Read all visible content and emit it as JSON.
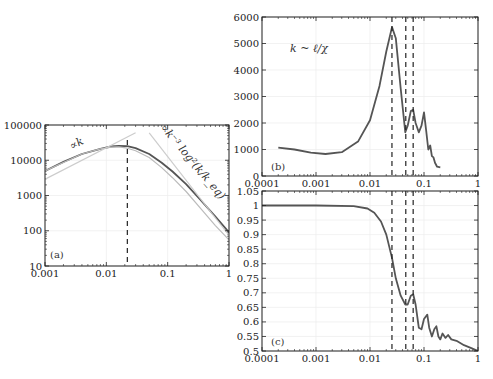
{
  "chart_data": [
    {
      "id": "a",
      "type": "line",
      "panel_label": "(a)",
      "xscale": "log",
      "yscale": "log",
      "xlim": [
        0.001,
        1
      ],
      "ylim": [
        10,
        100000
      ],
      "xticks": [
        "0.001",
        "0.01",
        "0.1",
        "1"
      ],
      "yticks": [
        "10",
        "100",
        "1000",
        "10000",
        "100000"
      ],
      "grid": true,
      "annotations": [
        "∝k",
        "∝k⁻³ log²(k/k_eq)"
      ],
      "vlines": [
        0.022
      ],
      "series": [
        {
          "name": "main",
          "color": "#555555",
          "x": [
            0.001,
            0.002,
            0.004,
            0.008,
            0.012,
            0.016,
            0.022,
            0.03,
            0.05,
            0.08,
            0.12,
            0.2,
            0.35,
            0.6,
            1.0
          ],
          "y": [
            5000,
            9000,
            15000,
            21000,
            24500,
            25500,
            25000,
            22000,
            15000,
            8500,
            4800,
            2100,
            720,
            250,
            90
          ]
        },
        {
          "name": "light",
          "color": "#bbbbbb",
          "x": [
            0.001,
            0.004,
            0.008,
            0.012,
            0.016,
            0.022,
            0.03,
            0.05,
            0.08,
            0.12,
            0.2,
            0.35,
            0.6,
            1.0
          ],
          "y": [
            5000,
            15000,
            21000,
            23500,
            24000,
            22000,
            18500,
            12000,
            6200,
            3200,
            1300,
            420,
            140,
            55
          ]
        },
        {
          "name": "asymptote-k",
          "color": "#cccccc",
          "dashed": false,
          "x": [
            0.00085,
            0.03
          ],
          "y": [
            2500,
            60000
          ]
        },
        {
          "name": "asymptote-k-3",
          "color": "#cccccc",
          "x": [
            0.05,
            1.1
          ],
          "y": [
            60000,
            60
          ]
        }
      ]
    },
    {
      "id": "b",
      "type": "line",
      "panel_label": "(b)",
      "xscale": "log",
      "yscale": "linear",
      "xlim": [
        0.0001,
        1
      ],
      "ylim": [
        0,
        6000
      ],
      "xticks": [
        "0.0001",
        "0.001",
        "0.01",
        "0.1",
        "1"
      ],
      "yticks": [
        "0",
        "1000",
        "2000",
        "3000",
        "4000",
        "5000",
        "6000"
      ],
      "grid": true,
      "annotations": [
        "k ~ ℓ/χ"
      ],
      "vlines": [
        0.0255,
        0.046,
        0.063
      ],
      "series": [
        {
          "name": "main",
          "color": "#555555",
          "x": [
            0.0002,
            0.0004,
            0.0008,
            0.0015,
            0.003,
            0.006,
            0.01,
            0.015,
            0.02,
            0.0255,
            0.03,
            0.037,
            0.045,
            0.05,
            0.057,
            0.063,
            0.07,
            0.08,
            0.09,
            0.1,
            0.11,
            0.12,
            0.13,
            0.14,
            0.15,
            0.16,
            0.175,
            0.2
          ],
          "y": [
            1070,
            1000,
            880,
            830,
            900,
            1300,
            2100,
            3400,
            4700,
            5620,
            5200,
            3300,
            1650,
            1900,
            2450,
            2500,
            2000,
            1650,
            1900,
            2400,
            1700,
            1000,
            1150,
            750,
            700,
            500,
            350,
            330
          ]
        }
      ]
    },
    {
      "id": "c",
      "type": "line",
      "panel_label": "(c)",
      "xscale": "log",
      "yscale": "linear",
      "xlim": [
        0.0001,
        1
      ],
      "ylim": [
        0.5,
        1.05
      ],
      "xticks": [
        "0.0001",
        "0.001",
        "0.01",
        "0.1",
        "1"
      ],
      "yticks": [
        "0.5",
        "0.55",
        "0.6",
        "0.65",
        "0.7",
        "0.75",
        "0.8",
        "0.85",
        "0.9",
        "0.95",
        "1",
        "1.05"
      ],
      "grid": true,
      "annotations": [],
      "vlines": [
        0.0255,
        0.046,
        0.063
      ],
      "series": [
        {
          "name": "main",
          "color": "#555555",
          "x": [
            0.0001,
            0.001,
            0.005,
            0.009,
            0.012,
            0.016,
            0.02,
            0.0255,
            0.03,
            0.037,
            0.045,
            0.05,
            0.057,
            0.063,
            0.07,
            0.08,
            0.09,
            0.1,
            0.115,
            0.125,
            0.14,
            0.155,
            0.17,
            0.185,
            0.2,
            0.22,
            0.25,
            0.28,
            0.32,
            0.4,
            0.55,
            0.75,
            1.0
          ],
          "y": [
            1.0,
            1.0,
            0.998,
            0.99,
            0.975,
            0.945,
            0.9,
            0.82,
            0.75,
            0.69,
            0.66,
            0.66,
            0.69,
            0.695,
            0.66,
            0.58,
            0.575,
            0.61,
            0.625,
            0.58,
            0.55,
            0.575,
            0.585,
            0.55,
            0.54,
            0.56,
            0.545,
            0.555,
            0.54,
            0.535,
            0.52,
            0.51,
            0.5
          ]
        }
      ]
    }
  ]
}
